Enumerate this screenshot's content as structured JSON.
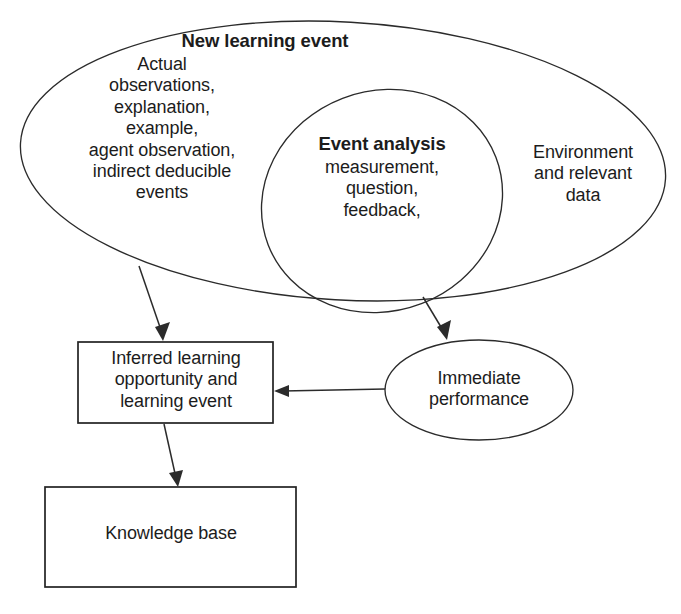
{
  "diagram": {
    "type": "venn-flow-diagram",
    "background_color": "#ffffff",
    "stroke_color": "#2b2b2b",
    "text_color": "#1c1c1c",
    "nodes": {
      "new_learning_event": {
        "shape": "ellipse",
        "title": "New learning event",
        "body": "Actual\nobservations,\nexplanation,\nexample,\nagent observation,\nindirect deducible\nevents"
      },
      "event_analysis": {
        "shape": "ellipse",
        "title": "Event analysis",
        "body": "measurement,\nquestion,\nfeedback,"
      },
      "environment": {
        "shape": "ellipse-region",
        "body": "Environment\nand relevant\ndata"
      },
      "inferred_learning": {
        "shape": "rectangle",
        "body": "Inferred learning\nopportunity and\nlearning event"
      },
      "immediate_performance": {
        "shape": "ellipse",
        "body": "Immediate\nperformance"
      },
      "knowledge_base": {
        "shape": "rectangle",
        "body": "Knowledge base"
      }
    },
    "edges": [
      {
        "id": "edge-nle-to-inferred",
        "from": "new_learning_event",
        "to": "inferred_learning",
        "style": "arrow"
      },
      {
        "id": "edge-nle-to-immediate",
        "from": "new_learning_event",
        "to": "immediate_performance",
        "style": "arrow"
      },
      {
        "id": "edge-immediate-to-inferred",
        "from": "immediate_performance",
        "to": "inferred_learning",
        "style": "arrow"
      },
      {
        "id": "edge-inferred-to-knowledge",
        "from": "inferred_learning",
        "to": "knowledge_base",
        "style": "arrow"
      }
    ]
  }
}
